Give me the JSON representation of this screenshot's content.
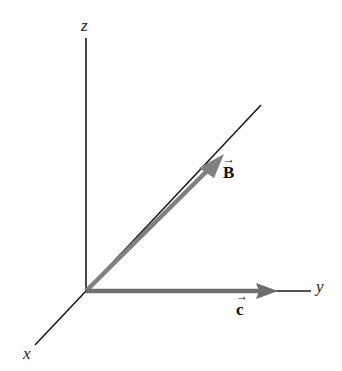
{
  "diagram": {
    "type": "3d-coordinate-axes-with-vectors",
    "axes": {
      "z": {
        "label": "z"
      },
      "y": {
        "label": "y"
      },
      "x": {
        "label": "x"
      }
    },
    "vectors": [
      {
        "name": "B",
        "label": "B",
        "arrow": "→",
        "color": "#808080",
        "direction": "along diagonal in y-z plane"
      },
      {
        "name": "C",
        "label": "c",
        "arrow": "→",
        "color": "#6e6e6e",
        "direction": "along +y axis"
      }
    ],
    "colors": {
      "axis": "#1a1a1a",
      "vector": "#808080",
      "background": "#ffffff"
    }
  }
}
